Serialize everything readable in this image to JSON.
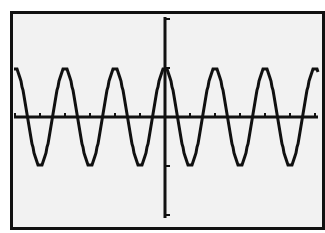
{
  "chart_data": {
    "type": "line",
    "title": "",
    "xlabel": "",
    "ylabel": "",
    "function": "y = cos(x)",
    "xlim": [
      -19.0,
      19.3
    ],
    "ylim": [
      -2,
      2
    ],
    "xscl": 3.1416,
    "yscl": 1,
    "grid": false,
    "legend": null,
    "amplitude": 1,
    "period": 6.2832,
    "series": [
      {
        "name": "Y1",
        "peaks_x": [
          -18.85,
          -12.57,
          -6.28,
          0,
          6.28,
          12.57,
          18.85
        ],
        "troughs_x": [
          -15.71,
          -9.42,
          -3.14,
          3.14,
          9.42,
          15.71
        ],
        "peak_y": 1,
        "trough_y": -1
      }
    ]
  },
  "colors": {
    "screen_bg": "#f2f2f2",
    "ink": "#111111",
    "frame": "#111111"
  },
  "screen": {
    "px_left": 14,
    "px_right": 318,
    "px_top": 17,
    "px_bottom": 218,
    "origin_px_x": 165,
    "origin_px_y": 117,
    "px_per_period": 50,
    "px_per_y_unit": 49
  }
}
